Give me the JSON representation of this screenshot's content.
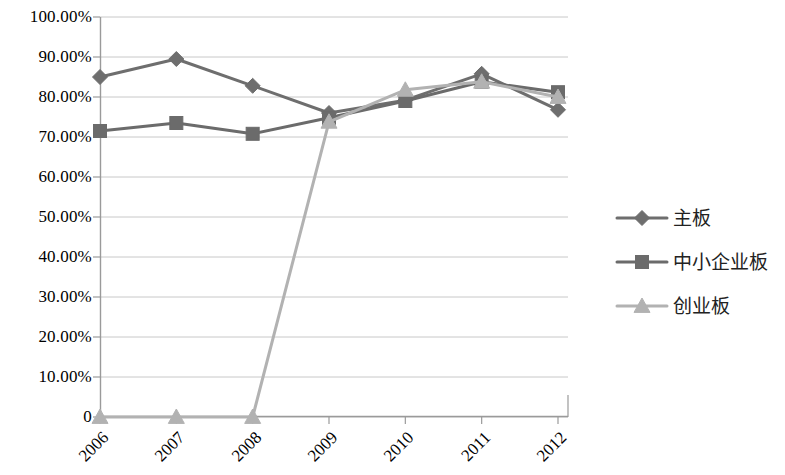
{
  "chart_data": {
    "type": "line",
    "title": "",
    "xlabel": "",
    "ylabel": "",
    "categories": [
      "2006",
      "2007",
      "2008",
      "2009",
      "2010",
      "2011",
      "2012"
    ],
    "ylim": [
      0,
      100
    ],
    "y_ticks": [
      0,
      10,
      20,
      30,
      40,
      50,
      60,
      70,
      80,
      90,
      100
    ],
    "y_tick_labels": [
      "0",
      "10.00%",
      "20.00%",
      "30.00%",
      "40.00%",
      "50.00%",
      "60.00%",
      "70.00%",
      "80.00%",
      "90.00%",
      "100.00%"
    ],
    "grid": true,
    "legend_position": "right",
    "series": [
      {
        "name": "主板",
        "marker": "diamond",
        "color": "#6e6e6e",
        "values": [
          85.0,
          89.5,
          82.8,
          76.0,
          79.2,
          85.8,
          76.8
        ]
      },
      {
        "name": "中小企业板",
        "marker": "square",
        "color": "#6b6b6b",
        "values": [
          71.5,
          73.5,
          70.8,
          74.8,
          79.0,
          83.8,
          81.2
        ]
      },
      {
        "name": "创业板",
        "marker": "triangle",
        "color": "#b2b2b2",
        "values": [
          0,
          0,
          0,
          73.8,
          81.8,
          83.8,
          80.0
        ]
      }
    ]
  },
  "axes": {
    "y_labels": [
      {
        "text": "100.00%",
        "value": 100
      },
      {
        "text": "90.00%",
        "value": 90
      },
      {
        "text": "80.00%",
        "value": 80
      },
      {
        "text": "70.00%",
        "value": 70
      },
      {
        "text": "60.00%",
        "value": 60
      },
      {
        "text": "50.00%",
        "value": 50
      },
      {
        "text": "40.00%",
        "value": 40
      },
      {
        "text": "30.00%",
        "value": 30
      },
      {
        "text": "20.00%",
        "value": 20
      },
      {
        "text": "10.00%",
        "value": 10
      },
      {
        "text": "0",
        "value": 0
      }
    ],
    "x_labels": [
      "2006",
      "2007",
      "2008",
      "2009",
      "2010",
      "2011",
      "2012"
    ]
  },
  "legend": {
    "items": [
      {
        "label": "主板",
        "marker": "diamond-marker-icon",
        "color": "#6e6e6e"
      },
      {
        "label": "中小企业板",
        "marker": "square-marker-icon",
        "color": "#6b6b6b"
      },
      {
        "label": "创业板",
        "marker": "triangle-marker-icon",
        "color": "#b2b2b2"
      }
    ]
  },
  "style": {
    "axis_color": "#9a9a9a",
    "grid_color": "#c8c8c8",
    "plot_background": "#ffffff"
  }
}
